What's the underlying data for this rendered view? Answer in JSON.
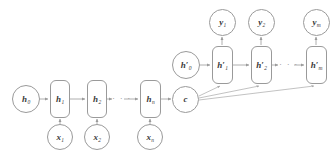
{
  "figure": {
    "type": "encoder-decoder-rnn-diagram",
    "background_color": "#ffffff",
    "stroke_color": "#9a9a9a",
    "text_color": "#3a3a3a"
  },
  "encoder": {
    "initial_state": {
      "label": "h",
      "sub": "0",
      "prime": false
    },
    "cells": [
      {
        "label": "h",
        "sub": "1",
        "prime": false
      },
      {
        "label": "h",
        "sub": "2",
        "prime": false
      },
      {
        "label": "h",
        "sub": "n",
        "prime": false
      }
    ],
    "inputs": [
      {
        "label": "x",
        "sub": "1"
      },
      {
        "label": "x",
        "sub": "2"
      },
      {
        "label": "x",
        "sub": "n"
      }
    ],
    "ellipsis": "· · ·"
  },
  "context": {
    "label": "c",
    "sub": ""
  },
  "decoder": {
    "initial_state": {
      "label": "h",
      "sub": "0",
      "prime": true
    },
    "cells": [
      {
        "label": "h",
        "sub": "1",
        "prime": true
      },
      {
        "label": "h",
        "sub": "2",
        "prime": true
      },
      {
        "label": "h",
        "sub": "m",
        "prime": true
      }
    ],
    "outputs": [
      {
        "label": "y",
        "sub": "1"
      },
      {
        "label": "y",
        "sub": "2"
      },
      {
        "label": "y",
        "sub": "m"
      }
    ],
    "ellipsis": "· · ·"
  }
}
